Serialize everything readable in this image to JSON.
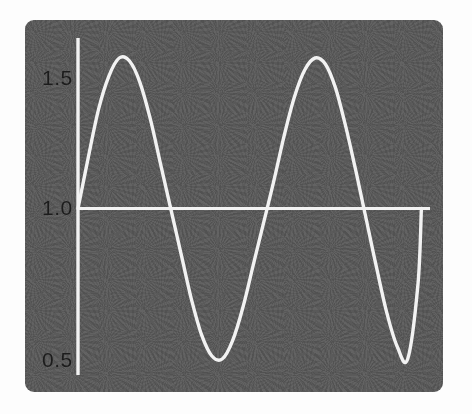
{
  "figure": {
    "name": "sine-waveform-plot",
    "background_color": "#ffffff",
    "panel_color": "#5a5a5a",
    "curve_color": "#f2f2f2",
    "axis_color": "#f2f2f2",
    "label_color": "#1c1c1c"
  },
  "chart_data": {
    "type": "line",
    "title": "",
    "subtitle": "",
    "xlabel": "",
    "ylabel": "",
    "xlim": [
      0,
      2.05
    ],
    "ylim": [
      0.5,
      1.5
    ],
    "grid": false,
    "legend": null,
    "legend_position": "none",
    "y_ticks": [
      {
        "value": 1.5,
        "label": "1.5"
      },
      {
        "value": 1.0,
        "label": "1.0"
      },
      {
        "value": 0.5,
        "label": "0.5"
      }
    ],
    "x_ticks": [],
    "series": [
      {
        "name": "waveform",
        "description": "oscillation about 1.0 with amplitude 0.5, two cycles",
        "baseline": 1.0,
        "amplitude": 0.5,
        "cycles": 2,
        "x": [
          0.0,
          0.06,
          0.12,
          0.18,
          0.24,
          0.3,
          0.36,
          0.42,
          0.48,
          0.54,
          0.6,
          0.66,
          0.72,
          0.78,
          0.84,
          0.9,
          0.96,
          1.02,
          1.08,
          1.14,
          1.2,
          1.26,
          1.32,
          1.38,
          1.44,
          1.5,
          1.56,
          1.62,
          1.68,
          1.74,
          1.8,
          1.86,
          1.92,
          1.98,
          2.0
        ],
        "y": [
          1.0,
          1.17,
          1.33,
          1.44,
          1.5,
          1.49,
          1.42,
          1.3,
          1.15,
          1.0,
          0.85,
          0.7,
          0.58,
          0.51,
          0.5,
          0.56,
          0.67,
          0.81,
          0.95,
          1.09,
          1.24,
          1.37,
          1.46,
          1.5,
          1.48,
          1.4,
          1.27,
          1.12,
          0.96,
          0.8,
          0.65,
          0.54,
          0.5,
          0.75,
          1.0
        ]
      }
    ],
    "annotations": [
      {
        "kind": "axis-line",
        "orientation": "vertical",
        "at": 0.0
      },
      {
        "kind": "axis-line",
        "orientation": "horizontal",
        "at": 1.0
      }
    ],
    "extrema": [
      {
        "kind": "peak",
        "index": 1,
        "x": 0.245,
        "y": 1.5
      },
      {
        "kind": "trough",
        "index": 1,
        "x": 0.785,
        "y": 0.5
      },
      {
        "kind": "peak",
        "index": 2,
        "x": 1.375,
        "y": 1.5
      },
      {
        "kind": "trough",
        "index": 2,
        "x": 1.905,
        "y": 0.5
      }
    ]
  }
}
